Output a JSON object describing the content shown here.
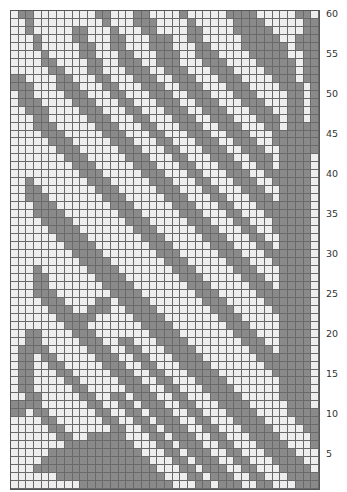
{
  "chart_data": {
    "type": "table",
    "columns": 40,
    "rows": 60,
    "row_labels": [
      "5",
      "10",
      "15",
      "20",
      "25",
      "30",
      "35",
      "40",
      "45",
      "50",
      "55",
      "60"
    ],
    "colors": {
      "background": "#eeeeee",
      "contrast": "#8a8a8a",
      "grid": "#6a6a6a"
    },
    "grid_rows_top_to_bottom": [
      "0110000000011000110000100000111100000110",
      "0010000000001000111000010000011110000011",
      "0010000011000100011000011000011111000011",
      "0001000011000110001110011000001111100111",
      "0001000001100110001110001100001111110111",
      "0000100001100011000111001110000111110011",
      "0000110000110011100111000111000011111011",
      "0000011000110001110011100011100001111011",
      "1100001100011000111001110001110000111011",
      "1110001110001100011100111000111000011101",
      "0110000111000110001110011100011100001101",
      "0111000011100011000111001110001110001101",
      "0011100001110001100011100111000111001101",
      "0001100000111000110001110011100011101101",
      "0001110000011100011000111001110001101111",
      "0000111000001110001100011100111000111111",
      "0000011100000111000110001110011100111111",
      "0000001110000011100011000111001110011111",
      "0000000111000001110001100011100111011110",
      "0000000011100000111000110001110011011110",
      "0000000001110000011100011000111001111110",
      "0010000000111000001110001100011100111110",
      "0011000000011100000111000110001110011110",
      "0011100000001110000011100011000111011110",
      "0001110000000111000001110001100011111110",
      "0001111000000011100000111000110001111110",
      "0000111100000001110000011100011000111110",
      "0000011110000000111000001110001100111110",
      "0000001111000000011100000111000110011110",
      "0000000111100000001110000011100011011110",
      "0000000011110000000111000001110001111110",
      "0000000001111000000011100000111000111110",
      "0001000000111100000001110000011100011110",
      "0001100000011110000000111000001110011110",
      "0001100000001111000000011100000111011110",
      "0001110000000111100000001110000011111110",
      "0000111000011011110000000111000001111110",
      "0000011100111001111000000011100000111110",
      "0000001111100000111100000001110000011110",
      "0000000111000000011110000000111000011110",
      "0011000011100000001111000000011100011110",
      "0011000001110011000111100000001110011110",
      "0111100000111001100011110000000111011110",
      "0110110000011100110001111000000011111110",
      "0110011000001110011000111100000001111110",
      "0110001100000111001100011110000000111110",
      "0110000110000011100110001111000000011110",
      "0110000011000001110011000111100000011110",
      "0011000001100110111001100011110000011110",
      "1111000000110011011100110001111000001110",
      "1101100000011001101110011000111100001111",
      "0000110000001100110111001100011110000111",
      "0000011000000110011011100110001111000011",
      "0000001100111110001101110011000111100001",
      "0000000111111111000110111001100011110001",
      "0000011111111111100011011100110001111000",
      "0000111111111111110001101110011000111100",
      "0001111111111111111000110111001100011110",
      "0000001111111111111100011011100110001111",
      "0000000001111111111110001101110011000111"
    ]
  }
}
